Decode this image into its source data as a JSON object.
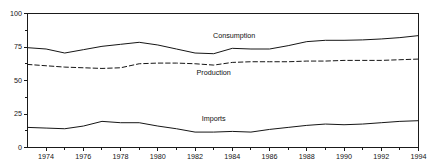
{
  "chart_data": {
    "type": "line",
    "title": "",
    "subtitle": "",
    "xlabel": "",
    "ylabel": "",
    "xlim": [
      1973,
      1994
    ],
    "ylim": [
      0,
      100
    ],
    "grid": false,
    "legend_position": "inline-annotations",
    "x": [
      1973,
      1974,
      1975,
      1976,
      1977,
      1978,
      1979,
      1980,
      1981,
      1982,
      1983,
      1984,
      1985,
      1986,
      1987,
      1988,
      1989,
      1990,
      1991,
      1992,
      1993,
      1994
    ],
    "y_ticks": [
      0,
      25,
      50,
      75,
      100
    ],
    "y_tick_labels": [
      "0",
      "25",
      "50",
      "75",
      "100"
    ],
    "y_minor_ticks": [
      12.5,
      37.5,
      62.5,
      87.5
    ],
    "x_ticks": [
      1974,
      1976,
      1978,
      1980,
      1982,
      1984,
      1986,
      1988,
      1990,
      1992,
      1994
    ],
    "x_tick_labels": [
      "1974",
      "1976",
      "1978",
      "1980",
      "1982",
      "1984",
      "1986",
      "1988",
      "1990",
      "1992",
      "1994"
    ],
    "x_minor_ticks": [
      1975,
      1977,
      1979,
      1981,
      1983,
      1985,
      1987,
      1989,
      1991,
      1993
    ],
    "series": [
      {
        "name": "Consumption",
        "style": "solid",
        "color": "#161616",
        "label_x": 1984.1,
        "label_y": 81.5,
        "values": [
          74.5,
          73.5,
          70.5,
          73.0,
          75.5,
          77.0,
          78.5,
          76.5,
          73.5,
          70.5,
          70.0,
          74.0,
          73.5,
          73.5,
          76.0,
          79.0,
          80.0,
          80.0,
          80.3,
          81.0,
          82.0,
          83.5
        ]
      },
      {
        "name": "Production",
        "style": "dashed",
        "color": "#161616",
        "label_x": 1983.0,
        "label_y": 54.0,
        "values": [
          62.0,
          61.0,
          60.0,
          59.5,
          59.0,
          59.5,
          62.5,
          63.0,
          63.0,
          62.5,
          61.5,
          63.5,
          64.0,
          64.0,
          64.0,
          64.5,
          64.5,
          65.0,
          65.0,
          65.0,
          65.5,
          66.0
        ]
      },
      {
        "name": "Imports",
        "style": "solid",
        "color": "#161616",
        "label_x": 1983.0,
        "label_y": 19.5,
        "values": [
          15.0,
          14.5,
          14.0,
          16.0,
          19.5,
          18.5,
          18.5,
          16.0,
          14.0,
          11.5,
          11.5,
          12.0,
          11.5,
          13.5,
          15.0,
          16.5,
          17.5,
          17.0,
          17.5,
          18.5,
          19.5,
          20.0
        ]
      }
    ]
  },
  "axes": {
    "frame_color": "#1a1a1a"
  }
}
